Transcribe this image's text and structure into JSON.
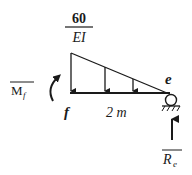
{
  "diagram": {
    "type": "beam-load-diagram",
    "load_label": {
      "numerator": "60",
      "denominator": "EI"
    },
    "moment_label": {
      "symbol": "M",
      "subscript": "f"
    },
    "reaction_label": {
      "symbol": "R",
      "subscript": "e"
    },
    "point_left": "f",
    "point_right": "e",
    "span_label": "2 m",
    "load_shape": "triangular",
    "support_right": "roller",
    "colors": {
      "stroke": "#1a1a1a",
      "background": "#ffffff"
    }
  }
}
